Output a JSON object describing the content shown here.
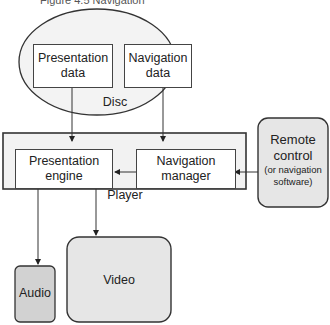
{
  "caption": "Figure 4.5 Navigation",
  "disc": {
    "label": "Disc",
    "items": [
      {
        "label": "Presentation data"
      },
      {
        "label": "Navigation data"
      }
    ]
  },
  "player": {
    "label": "Player",
    "items": [
      {
        "label": "Presentation engine"
      },
      {
        "label": "Navigation manager"
      }
    ]
  },
  "remote": {
    "title": "Remote control",
    "subtitle": "(or navigation software)"
  },
  "outputs": {
    "video": "Video",
    "audio": "Audio"
  },
  "colors": {
    "fill_light": "#f2f2f2",
    "fill_mid": "#e6e6e6",
    "fill_dark": "#d2d2d2",
    "stroke": "#333333"
  }
}
